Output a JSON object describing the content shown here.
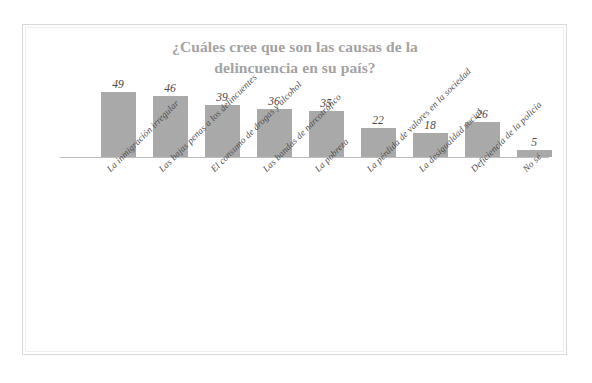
{
  "chart_data": {
    "type": "bar",
    "title": "¿Cuáles cree que son las causas de la delincuencia en su país?",
    "title_line1": "¿Cuáles cree que son las causas de la",
    "title_line2": "delincuencia en su país?",
    "xlabel": "",
    "ylabel": "",
    "ylim": [
      0,
      52
    ],
    "grid": false,
    "legend": "none",
    "axis_ticks_visible": false,
    "categories": [
      "La inmigración irregular",
      "Las bajas penas a los delincuentes",
      "El consumo de drogas y alcohol",
      "Las bandas de narcotráfico",
      "La pobreza",
      "La pérdida de valores en la sociedad",
      "La desigualdad social",
      "Deficiencia de la policía",
      "No sé"
    ],
    "values": [
      49,
      46,
      39,
      36,
      35,
      22,
      18,
      26,
      5
    ],
    "data_labels": [
      "49",
      "46",
      "39",
      "36",
      "35",
      "22",
      "18",
      "26",
      "5"
    ],
    "colors": {
      "bar": "#a9a9a9",
      "title": "#a3a3a3",
      "axis": "#bdbdbd",
      "value_label": "#4a4a4a",
      "category_label": "#4d4d4d",
      "background": "#ffffff",
      "frame": "#d9d9d9"
    }
  }
}
